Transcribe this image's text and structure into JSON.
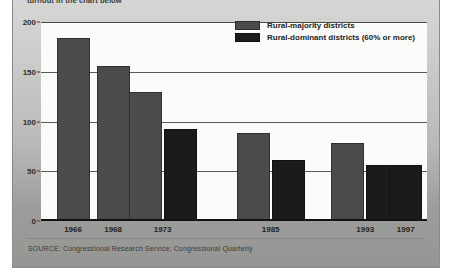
{
  "panel": {
    "kicker": "turnout in the chart below",
    "source": "SOURCE: Congressional Research Service; Congressional Quarterly"
  },
  "colors": {
    "majority": "#4b4b49",
    "dominant": "#1b1b19",
    "panel_bg": "#c6c6c4",
    "plot_bg": "#fbfbfa",
    "axis": "#121211"
  },
  "legend": {
    "items": [
      {
        "key": "majority",
        "label": "Rural-majority districts"
      },
      {
        "key": "dominant",
        "label": "Rural-dominant districts (60% or more)"
      }
    ]
  },
  "chart_data": {
    "type": "bar",
    "title": "",
    "xlabel": "",
    "ylabel": "",
    "ylim": [
      0,
      200
    ],
    "yticks": [
      0,
      50,
      100,
      150,
      200
    ],
    "grid": true,
    "legend_position": "top-right",
    "categories": [
      "1966",
      "1968",
      "1973",
      "1985",
      "1993",
      "1997"
    ],
    "series": [
      {
        "name": "Rural-majority districts",
        "values": [
          184,
          156,
          130,
          88,
          78,
          null
        ]
      },
      {
        "name": "Rural-dominant districts (60% or more)",
        "values": [
          null,
          null,
          92,
          61,
          56,
          56
        ]
      }
    ]
  }
}
